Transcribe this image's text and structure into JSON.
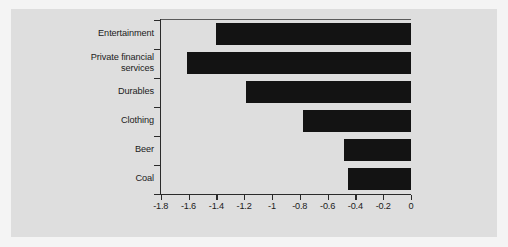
{
  "chart_data": {
    "type": "bar",
    "orientation": "horizontal",
    "title": "",
    "subtitle": "",
    "xlabel": "",
    "ylabel": "",
    "categories": [
      "Entertainment",
      "Private financial\nservices",
      "Durables",
      "Clothing",
      "Beer",
      "Coal"
    ],
    "values": [
      -1.4,
      -1.61,
      -1.19,
      -0.78,
      -0.48,
      -0.45
    ],
    "series": [
      {
        "name": "",
        "values": [
          -1.4,
          -1.61,
          -1.19,
          -0.78,
          -0.48,
          -0.45
        ]
      }
    ],
    "xlim": [
      -1.8,
      0
    ],
    "xticks": [
      -1.8,
      -1.6,
      -1.4,
      -1.2,
      -1,
      -0.8,
      -0.6,
      -0.4,
      -0.2,
      0
    ],
    "xticklabels": [
      "-1.8",
      "-1.6",
      "-1.4",
      "-1.2",
      "-1",
      "-0.8",
      "-0.6",
      "-0.4",
      "-0.2",
      "0"
    ],
    "grid": false,
    "legend": null,
    "bar_color": "#131313",
    "background_color": "#dedede",
    "axis_color": "#2a2a2a"
  }
}
